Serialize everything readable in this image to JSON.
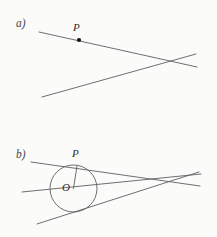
{
  "figure": {
    "background_color": "#fbfbfa",
    "stroke_color": "#5d5f62",
    "label_color": "#46484b",
    "point_color": "#141414",
    "width": 217,
    "height": 237
  },
  "panels": [
    {
      "id": "a",
      "label": "a)",
      "label_x": 16,
      "label_y": 18,
      "description": "Two straight lines crossing near the right edge, with a marked point P on the upper line",
      "points": [
        {
          "name": "P",
          "label": "P",
          "x": 79,
          "y": 40,
          "label_x": 73,
          "label_y": 22,
          "dot": true,
          "dot_radius": 2.1
        }
      ],
      "lines": [
        {
          "name": "upper-line",
          "x1": 39,
          "y1": 32,
          "x2": 197,
          "y2": 67
        },
        {
          "name": "lower-line",
          "x1": 42,
          "y1": 97,
          "x2": 196,
          "y2": 54
        }
      ],
      "intersection": {
        "x": 182,
        "y": 60
      }
    },
    {
      "id": "b",
      "label": "b)",
      "label_x": 16,
      "label_y": 149,
      "description": "A circle with centre O inscribed between two tangent lines meeting at a point on the right; a third line passes through O; point P is the tangency point on the upper tangent",
      "circle": {
        "name": "inscribed-circle",
        "cx": 73.5,
        "cy": 188.5,
        "r": 23.5
      },
      "points": [
        {
          "name": "P",
          "label": "P",
          "x": 77,
          "y": 166,
          "label_x": 72,
          "label_y": 148,
          "dot": false
        },
        {
          "name": "O",
          "label": "O",
          "x": 73.5,
          "y": 188.5,
          "label_x": 62,
          "label_y": 182,
          "dot": false
        }
      ],
      "lines": [
        {
          "name": "upper-tangent-line",
          "x1": 31,
          "y1": 162,
          "x2": 200,
          "y2": 186
        },
        {
          "name": "axis-line-through-centre",
          "x1": 22,
          "y1": 192,
          "x2": 201,
          "y2": 174
        },
        {
          "name": "lower-tangent-line",
          "x1": 37,
          "y1": 224,
          "x2": 199,
          "y2": 172
        },
        {
          "name": "radius-segment-to-P",
          "x1": 73.5,
          "y1": 188.5,
          "x2": 77,
          "y2": 166
        }
      ],
      "apex": {
        "x": 182,
        "y": 180
      }
    }
  ]
}
